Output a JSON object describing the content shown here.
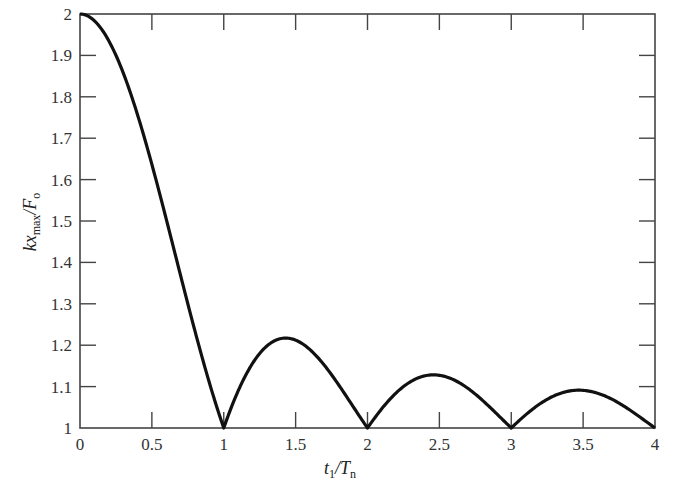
{
  "chart_data": {
    "type": "line",
    "title": "",
    "xlabel": "t1/Tn",
    "ylabel": "kx_max/F_o",
    "xlim": [
      0,
      4
    ],
    "ylim": [
      1,
      2
    ],
    "grid": false,
    "legend": null,
    "x_ticks": [
      0,
      0.5,
      1,
      1.5,
      2,
      2.5,
      3,
      3.5,
      4
    ],
    "x_tick_labels": [
      "0",
      "0.5",
      "1",
      "1.5",
      "2",
      "2.5",
      "3",
      "3.5",
      "4"
    ],
    "y_ticks": [
      1,
      1.1,
      1.2,
      1.3,
      1.4,
      1.5,
      1.6,
      1.7,
      1.8,
      1.9,
      2
    ],
    "y_tick_labels": [
      "1",
      "1.1",
      "1.2",
      "1.3",
      "1.4",
      "1.5",
      "1.6",
      "1.7",
      "1.8",
      "1.9",
      "2"
    ],
    "series": [
      {
        "name": "kx_max/F_o",
        "color": "#111111",
        "x": [
          0,
          0.1,
          0.2,
          0.3,
          0.4,
          0.5,
          0.6,
          0.7,
          0.8,
          0.9,
          1.0,
          1.1,
          1.2,
          1.3,
          1.43,
          1.5,
          1.6,
          1.7,
          1.8,
          1.9,
          2.0,
          2.1,
          2.2,
          2.3,
          2.46,
          2.6,
          2.7,
          2.8,
          2.9,
          3.0,
          3.1,
          3.2,
          3.3,
          3.47,
          3.6,
          3.7,
          3.8,
          3.9,
          4.0
        ],
        "y": [
          2.0,
          1.984,
          1.935,
          1.858,
          1.757,
          1.637,
          1.505,
          1.368,
          1.234,
          1.109,
          1.0,
          1.089,
          1.156,
          1.198,
          1.217,
          1.212,
          1.189,
          1.152,
          1.104,
          1.052,
          1.0,
          1.047,
          1.085,
          1.112,
          1.129,
          1.116,
          1.1,
          1.067,
          1.034,
          1.0,
          1.032,
          1.059,
          1.078,
          1.091,
          1.084,
          1.07,
          1.049,
          1.025,
          1.0
        ]
      }
    ]
  },
  "labels": {
    "ylabel_main": "kx",
    "ylabel_sub": "max",
    "ylabel_tail": "/F",
    "ylabel_tail_sub": "o",
    "xlabel_main": "t",
    "xlabel_sub": "1",
    "xlabel_tail": "/T",
    "xlabel_tail_sub": "n"
  }
}
